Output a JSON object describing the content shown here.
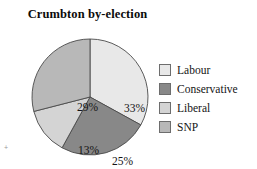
{
  "chart_data": {
    "type": "pie",
    "title": "Crumbton by-election",
    "categories": [
      "Labour",
      "Conservative",
      "Liberal",
      "SNP"
    ],
    "values": [
      33,
      25,
      13,
      29
    ],
    "value_labels": [
      "33%",
      "25%",
      "13%",
      "29%"
    ],
    "value_unit": "%",
    "colors": [
      "#e8e8e8",
      "#888888",
      "#d4d4d4",
      "#b8b8b8"
    ],
    "slice_border_color": "#4a4a4a",
    "start_angle_deg": 0,
    "direction": "clockwise",
    "legend_position": "right",
    "grid": false,
    "xlabel": "",
    "ylabel": "",
    "background": "#ffffff"
  },
  "title": {
    "text": "Crumbton by-election"
  },
  "slices": [
    {
      "label": "Labour",
      "percent_label": "33%",
      "value": 33,
      "color": "#e8e8e8"
    },
    {
      "label": "Conservative",
      "percent_label": "25%",
      "value": 25,
      "color": "#888888"
    },
    {
      "label": "Liberal",
      "percent_label": "13%",
      "value": 13,
      "color": "#d4d4d4"
    },
    {
      "label": "SNP",
      "percent_label": "29%",
      "value": 29,
      "color": "#b8b8b8"
    }
  ],
  "legend": {
    "items": [
      {
        "label": "Labour",
        "color": "#e8e8e8"
      },
      {
        "label": "Conservative",
        "color": "#888888"
      },
      {
        "label": "Liberal",
        "color": "#d4d4d4"
      },
      {
        "label": "SNP",
        "color": "#b8b8b8"
      }
    ]
  },
  "artifacts": {
    "edge_tick": "+"
  }
}
